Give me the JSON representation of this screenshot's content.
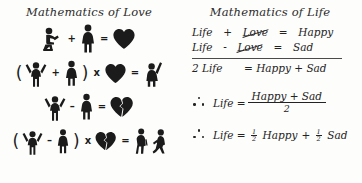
{
  "theme": {
    "background": "#fdfdfc",
    "ink": "#1b1b1b",
    "equation_ink": "#232323"
  },
  "left": {
    "title": "Mathematics of Love",
    "rows": [
      {
        "id": "row-proposal",
        "tokens": [
          {
            "kind": "icon",
            "name": "kneeling-proposing-man-icon"
          },
          {
            "kind": "op",
            "text": "+"
          },
          {
            "kind": "icon",
            "name": "standing-woman-icon"
          },
          {
            "kind": "op",
            "text": "="
          },
          {
            "kind": "icon",
            "name": "heart-icon"
          }
        ]
      },
      {
        "id": "row-multiply-heart",
        "tokens": [
          {
            "kind": "paren",
            "text": "("
          },
          {
            "kind": "icon",
            "name": "cheering-man-icon"
          },
          {
            "kind": "op",
            "text": "+"
          },
          {
            "kind": "icon",
            "name": "standing-woman-icon"
          },
          {
            "kind": "paren",
            "text": ")"
          },
          {
            "kind": "op",
            "text": "x"
          },
          {
            "kind": "icon",
            "name": "heart-icon"
          },
          {
            "kind": "op",
            "text": "="
          },
          {
            "kind": "icon",
            "name": "celebrating-woman-icon"
          }
        ]
      },
      {
        "id": "row-subtraction",
        "tokens": [
          {
            "kind": "icon",
            "name": "cheering-man-icon"
          },
          {
            "kind": "op",
            "text": "–"
          },
          {
            "kind": "icon",
            "name": "standing-woman-icon"
          },
          {
            "kind": "op",
            "text": "="
          },
          {
            "kind": "icon",
            "name": "broken-heart-icon"
          }
        ]
      },
      {
        "id": "row-multiply-broken-heart",
        "tokens": [
          {
            "kind": "paren",
            "text": "("
          },
          {
            "kind": "icon",
            "name": "cheering-man-icon"
          },
          {
            "kind": "op",
            "text": "–"
          },
          {
            "kind": "icon",
            "name": "standing-woman-icon"
          },
          {
            "kind": "paren",
            "text": ")"
          },
          {
            "kind": "op",
            "text": "x"
          },
          {
            "kind": "icon",
            "name": "broken-heart-icon"
          },
          {
            "kind": "op",
            "text": "="
          },
          {
            "kind": "icon",
            "name": "walking-away-woman-icon"
          },
          {
            "kind": "icon",
            "name": "walking-away-man-icon"
          }
        ]
      }
    ]
  },
  "right": {
    "title": "Mathematics of Life",
    "eq1": {
      "a": "Life",
      "op": "+",
      "cancelled": "Love",
      "eq": "=",
      "result": "Happy"
    },
    "eq2": {
      "a": "Life",
      "op": "-",
      "cancelled": "Love",
      "eq": "=",
      "result": "Sad"
    },
    "sum": {
      "lhs": "2 Life",
      "rhs": "= Happy + Sad"
    },
    "concl1": {
      "lhs": "Life  =",
      "numerator": "Happy + Sad",
      "denominator": "2"
    },
    "concl2": {
      "lhs": "Life  =",
      "frac1_num": "1",
      "frac1_den": "2",
      "term1": "Happy",
      "plus": "+",
      "frac2_num": "1",
      "frac2_den": "2",
      "term2": "Sad"
    }
  }
}
